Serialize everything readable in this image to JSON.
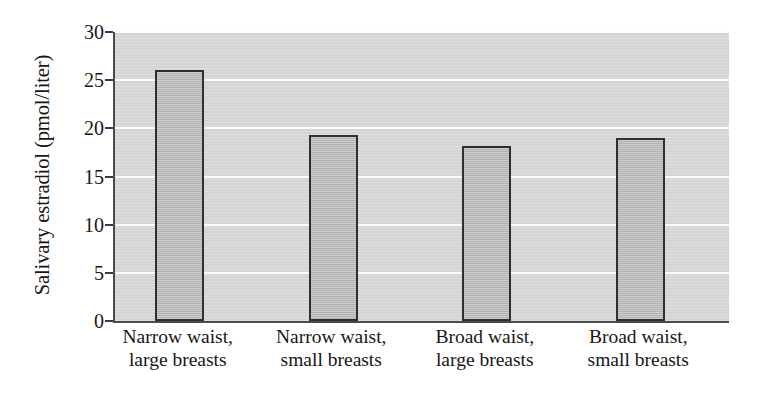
{
  "chart_data": {
    "type": "bar",
    "title": "",
    "subtitle": "",
    "xlabel": "",
    "ylabel": "Salivary estradiol (pmol/liter)",
    "categories": [
      "Narrow waist, large breasts",
      "Narrow waist, small breasts",
      "Broad waist, large breasts",
      "Broad waist, small breasts"
    ],
    "category_lines": [
      [
        "Narrow waist,",
        "large breasts"
      ],
      [
        "Narrow waist,",
        "small breasts"
      ],
      [
        "Broad waist,",
        "large breasts"
      ],
      [
        "Broad waist,",
        "small breasts"
      ]
    ],
    "values": [
      26.1,
      19.3,
      18.2,
      19.0
    ],
    "ylim": [
      0,
      30
    ],
    "yticks": [
      0,
      5,
      10,
      15,
      20,
      25,
      30
    ],
    "ytick_labels": [
      "0",
      "5",
      "10",
      "15",
      "20",
      "25",
      "30"
    ],
    "grid": true,
    "grid_axis": "y",
    "legend": false,
    "legend_position": "none",
    "colors": {
      "panel_background": "#d7d7d7",
      "gridline": "#fbfbfb",
      "bar_fill": "#b9b9b9",
      "bar_border": "#2f2f2f",
      "axis": "#4a4a4a",
      "text": "#171717",
      "figure_background": "#ffffff"
    }
  }
}
